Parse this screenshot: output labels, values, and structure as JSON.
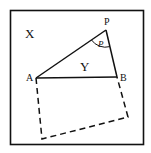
{
  "diagram": {
    "region_label": "X",
    "triangle_label": "Y",
    "angle_label": "P",
    "points": {
      "P": {
        "label": "P",
        "x": 106,
        "y": 30
      },
      "A": {
        "label": "A",
        "x": 36,
        "y": 78
      },
      "B": {
        "label": "B",
        "x": 117,
        "y": 77
      }
    },
    "square_corners": {
      "C": {
        "x": 128,
        "y": 117
      },
      "D": {
        "x": 42,
        "y": 139
      }
    },
    "frame": {
      "x": 10,
      "y": 10,
      "width": 134,
      "height": 135
    },
    "colors": {
      "stroke": "#111111",
      "background": "#ffffff"
    }
  }
}
